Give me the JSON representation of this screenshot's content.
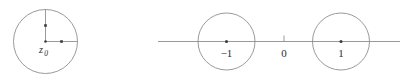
{
  "figure": {
    "background_color": "#ffffff",
    "stroke_color": "#808080",
    "text_color": "#2b2b2b",
    "marker_color": "#3a3a3a",
    "stroke_width": 0.8,
    "width": 413,
    "height": 82
  },
  "panels": [
    {
      "id": "left-panel",
      "name": "disk-about-z0",
      "circle": {
        "cx": 45.5,
        "cy": 41.5,
        "r": 32
      },
      "center_point": {
        "cx": 45.5,
        "cy": 41.5,
        "r": 1.3
      },
      "radius_up": {
        "x1": 45.5,
        "y1": 41.5,
        "x2": 45.5,
        "y2": 9.5,
        "marker": {
          "cx": 45.5,
          "cy": 25.5,
          "size": 2.6
        }
      },
      "radius_right": {
        "x1": 45.5,
        "y1": 41.5,
        "x2": 77.5,
        "y2": 41.5,
        "marker": {
          "cx": 61.5,
          "cy": 41.5,
          "size": 2.6
        }
      },
      "label": {
        "text": "z",
        "subscript": "0",
        "x": 41.0,
        "y": 53.0,
        "font_size": 10,
        "subscript_font_size": 7.5
      }
    },
    {
      "id": "right-panel",
      "name": "unit-disks-on-real-axis",
      "axis": {
        "x1": 158,
        "y1": 41.5,
        "x2": 400,
        "y2": 41.5
      },
      "tick_zero": {
        "x": 284,
        "y1": 35.5,
        "y2": 41.5
      },
      "circles": [
        {
          "name": "disk-at-minus-one",
          "cx": 226.5,
          "cy": 41.5,
          "r": 28.5,
          "center_point_r": 1.5,
          "label": {
            "text": "−1",
            "x": 226.5,
            "y": 57.0,
            "font_size": 11
          }
        },
        {
          "name": "disk-at-one",
          "cx": 341.0,
          "cy": 41.5,
          "r": 28.5,
          "center_point_r": 1.5,
          "label": {
            "text": "1",
            "x": 341.0,
            "y": 57.0,
            "font_size": 11
          }
        }
      ],
      "origin_label": {
        "text": "0",
        "x": 284,
        "y": 57.0,
        "font_size": 11
      }
    }
  ]
}
